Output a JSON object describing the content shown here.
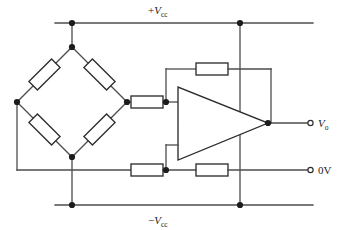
{
  "figure": {
    "background_color": "#ffffff",
    "wire_color": "#4d4d4d",
    "component_outline_color": "#2e2e2e",
    "node_color": "#1c1c1c",
    "width": 349,
    "height": 230
  },
  "labels": {
    "supply_positive": {
      "prefix": "+",
      "symbol": "V",
      "subscript": "cc",
      "full": "+Vcc"
    },
    "supply_negative": {
      "prefix": "−",
      "symbol": "V",
      "subscript": "cc",
      "full": "−Vcc"
    },
    "output": {
      "symbol": "V",
      "subscript": "o",
      "full": "Vo"
    },
    "ground": {
      "full": "0V"
    }
  },
  "components": {
    "bridge": {
      "name": "wheatstone-bridge",
      "resistor_count": 4,
      "resistors": [
        {
          "id": "bridge-resistor-top-left",
          "orientation": "diagonal-45"
        },
        {
          "id": "bridge-resistor-top-right",
          "orientation": "diagonal-135"
        },
        {
          "id": "bridge-resistor-bottom-left",
          "orientation": "diagonal-135"
        },
        {
          "id": "bridge-resistor-bottom-right",
          "orientation": "diagonal-45"
        }
      ]
    },
    "amplifier": {
      "name": "operational-amplifier",
      "shape": "triangle",
      "inputs": 2,
      "outputs": 1
    },
    "resistors": [
      {
        "id": "input-resistor",
        "orientation": "horizontal"
      },
      {
        "id": "feedback-resistor",
        "orientation": "horizontal"
      },
      {
        "id": "reference-resistor-left",
        "orientation": "horizontal"
      },
      {
        "id": "reference-resistor-right",
        "orientation": "horizontal"
      }
    ]
  },
  "terminals": [
    {
      "id": "output-terminal",
      "label": "Vo",
      "type": "open-circle"
    },
    {
      "id": "ground-terminal",
      "label": "0V",
      "type": "open-circle"
    }
  ],
  "nodes": [
    {
      "id": "node-vcc-bridge",
      "x": 72,
      "y": 23
    },
    {
      "id": "node-vcc-right",
      "x": 240,
      "y": 23
    },
    {
      "id": "node-bridge-top",
      "x": 72,
      "y": 47
    },
    {
      "id": "node-bridge-left",
      "x": 17,
      "y": 102
    },
    {
      "id": "node-bridge-right",
      "x": 127,
      "y": 102
    },
    {
      "id": "node-bridge-bottom",
      "x": 72,
      "y": 157
    },
    {
      "id": "node-inverting-input",
      "x": 166,
      "y": 102
    },
    {
      "id": "node-noninverting-input",
      "x": 166,
      "y": 170
    },
    {
      "id": "node-output",
      "x": 268,
      "y": 123
    },
    {
      "id": "node-vee-bridge",
      "x": 72,
      "y": 205
    },
    {
      "id": "node-vee-right",
      "x": 240,
      "y": 205
    }
  ]
}
